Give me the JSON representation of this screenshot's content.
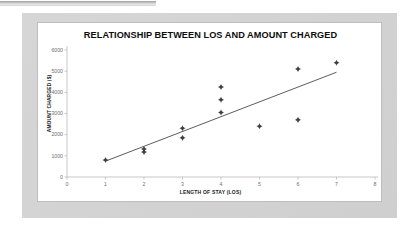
{
  "document": {
    "top_strip_present": true
  },
  "chart_data": {
    "type": "scatter",
    "title": "RELATIONSHIP BETWEEN LOS AND AMOUNT CHARGED",
    "xlabel": "LENGTH OF STAY (LOS)",
    "ylabel": "AMOUNT CHARGED ($)",
    "xlim": [
      0,
      8
    ],
    "ylim": [
      0,
      6000
    ],
    "xticks": [
      0,
      1,
      2,
      3,
      4,
      5,
      6,
      7,
      8
    ],
    "yticks": [
      0,
      1000,
      2000,
      3000,
      4000,
      5000,
      6000
    ],
    "xtick_labels": [
      "0",
      "1",
      "2",
      "3",
      "4",
      "5",
      "6",
      "7",
      "8"
    ],
    "ytick_labels": [
      "0",
      "1000",
      "2000",
      "3000",
      "4000",
      "5000",
      "6000"
    ],
    "grid": false,
    "legend": "none",
    "marker": "diamond-plus",
    "marker_color": "#404040",
    "points": [
      {
        "x": 1,
        "y": 800
      },
      {
        "x": 2,
        "y": 1180
      },
      {
        "x": 2,
        "y": 1320
      },
      {
        "x": 3,
        "y": 1850
      },
      {
        "x": 3,
        "y": 2300
      },
      {
        "x": 4,
        "y": 3050
      },
      {
        "x": 4,
        "y": 3650
      },
      {
        "x": 4,
        "y": 4250
      },
      {
        "x": 5,
        "y": 2400
      },
      {
        "x": 6,
        "y": 2700
      },
      {
        "x": 6,
        "y": 5100
      },
      {
        "x": 7,
        "y": 5400
      }
    ],
    "trendline": {
      "type": "linear",
      "color": "#4a4a4a",
      "x_start": 1,
      "y_start": 750,
      "x_end": 7,
      "y_end": 4950
    }
  }
}
